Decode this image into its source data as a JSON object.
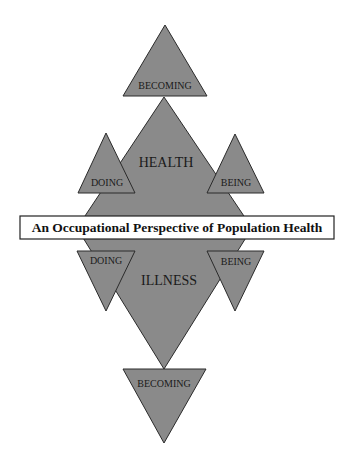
{
  "diagram": {
    "title": "An Occupational Perspective of Population Health",
    "fill_color": "#8a8a8a",
    "upper": {
      "center_label": "HEALTH",
      "top_label": "BECOMING",
      "left_label": "DOING",
      "right_label": "BEING"
    },
    "lower": {
      "center_label": "ILLNESS",
      "bottom_label": "BECOMING",
      "left_label": "DOING",
      "right_label": "BEING"
    }
  }
}
